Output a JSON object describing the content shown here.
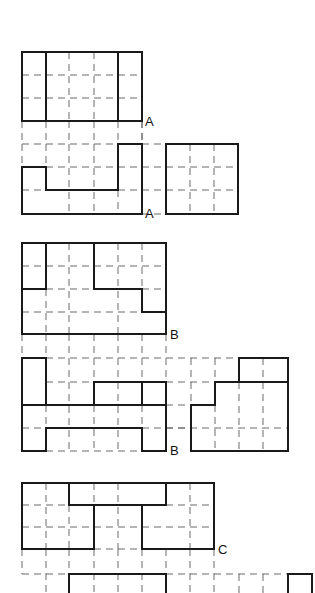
{
  "diagram": {
    "title": "",
    "colors": {
      "solid": "#1a1a1a",
      "dashed": "#6a6a6a",
      "background": "#ffffff"
    },
    "figures": [
      {
        "id": "A-top",
        "label": "A",
        "label_pos": [
          145,
          126
        ],
        "dashed": [
          [
            22,
            75,
            142,
            75
          ],
          [
            22,
            98,
            142,
            98
          ],
          [
            69,
            52,
            69,
            121
          ],
          [
            94,
            52,
            94,
            121
          ],
          [
            22,
            121,
            22,
            144
          ],
          [
            46,
            121,
            46,
            144
          ],
          [
            69,
            121,
            69,
            144
          ],
          [
            94,
            121,
            94,
            144
          ],
          [
            118,
            121,
            118,
            144
          ],
          [
            142,
            121,
            142,
            144
          ]
        ],
        "solid": [
          [
            22,
            52,
            142,
            52
          ],
          [
            22,
            121,
            142,
            121
          ],
          [
            22,
            52,
            22,
            121
          ],
          [
            142,
            52,
            142,
            121
          ],
          [
            46,
            52,
            46,
            121
          ],
          [
            118,
            52,
            118,
            121
          ]
        ]
      },
      {
        "id": "A-bottom",
        "label": "A",
        "label_pos": [
          145,
          218
        ],
        "dashed": [
          [
            22,
            144,
            166,
            144
          ],
          [
            22,
            167,
            166,
            167
          ],
          [
            22,
            190,
            166,
            190
          ],
          [
            46,
            144,
            46,
            167
          ],
          [
            69,
            144,
            69,
            214
          ],
          [
            94,
            144,
            94,
            214
          ],
          [
            118,
            167,
            118,
            190
          ],
          [
            118,
            190,
            118,
            214
          ],
          [
            22,
            144,
            22,
            167
          ],
          [
            142,
            121,
            142,
            144
          ],
          [
            142,
            214,
            166,
            214
          ],
          [
            166,
            167,
            238,
            167
          ],
          [
            166,
            190,
            238,
            190
          ],
          [
            190,
            144,
            190,
            214
          ],
          [
            214,
            144,
            214,
            214
          ]
        ],
        "solid": [
          [
            22,
            167,
            46,
            167
          ],
          [
            46,
            167,
            46,
            190
          ],
          [
            46,
            190,
            118,
            190
          ],
          [
            118,
            144,
            118,
            190
          ],
          [
            118,
            144,
            142,
            144
          ],
          [
            142,
            144,
            142,
            214
          ],
          [
            22,
            167,
            22,
            214
          ],
          [
            22,
            214,
            142,
            214
          ],
          [
            166,
            144,
            238,
            144
          ],
          [
            166,
            144,
            166,
            214
          ],
          [
            238,
            144,
            238,
            214
          ],
          [
            166,
            214,
            238,
            214
          ]
        ]
      },
      {
        "id": "B-top",
        "label": "B",
        "label_pos": [
          170,
          339
        ],
        "dashed": [
          [
            22,
            266,
            166,
            266
          ],
          [
            46,
            289,
            166,
            289
          ],
          [
            22,
            312,
            142,
            312
          ],
          [
            46,
            289,
            46,
            334
          ],
          [
            69,
            243,
            69,
            334
          ],
          [
            118,
            243,
            118,
            334
          ],
          [
            142,
            243,
            142,
            289
          ],
          [
            22,
            334,
            22,
            358
          ],
          [
            46,
            334,
            46,
            358
          ],
          [
            69,
            334,
            69,
            358
          ],
          [
            94,
            334,
            94,
            358
          ],
          [
            118,
            334,
            118,
            358
          ],
          [
            142,
            334,
            142,
            358
          ],
          [
            166,
            334,
            166,
            358
          ]
        ],
        "solid": [
          [
            22,
            243,
            166,
            243
          ],
          [
            22,
            243,
            22,
            334
          ],
          [
            166,
            243,
            166,
            334
          ],
          [
            22,
            334,
            166,
            334
          ],
          [
            46,
            243,
            46,
            289
          ],
          [
            22,
            289,
            46,
            289
          ],
          [
            94,
            243,
            94,
            289
          ],
          [
            94,
            289,
            142,
            289
          ],
          [
            142,
            289,
            142,
            312
          ],
          [
            142,
            312,
            166,
            312
          ]
        ]
      },
      {
        "id": "B-bottom",
        "label": "B",
        "label_pos": [
          170,
          455
        ],
        "dashed": [
          [
            46,
            358,
            239,
            358
          ],
          [
            46,
            382,
            94,
            382
          ],
          [
            166,
            382,
            215,
            382
          ],
          [
            22,
            428,
            46,
            428
          ],
          [
            142,
            428,
            288,
            428
          ],
          [
            166,
            405,
            191,
            405
          ],
          [
            69,
            358,
            69,
            451
          ],
          [
            94,
            358,
            94,
            382
          ],
          [
            94,
            405,
            94,
            451
          ],
          [
            118,
            358,
            118,
            451
          ],
          [
            142,
            358,
            142,
            382
          ],
          [
            142,
            405,
            142,
            428
          ],
          [
            166,
            358,
            166,
            382
          ],
          [
            191,
            358,
            191,
            405
          ],
          [
            215,
            358,
            215,
            382
          ],
          [
            215,
            405,
            215,
            451
          ],
          [
            239,
            382,
            239,
            451
          ],
          [
            263,
            358,
            263,
            451
          ],
          [
            46,
            405,
            46,
            428
          ],
          [
            46,
            451,
            142,
            451
          ],
          [
            166,
            428,
            191,
            428
          ]
        ],
        "solid": [
          [
            22,
            358,
            46,
            358
          ],
          [
            22,
            358,
            22,
            451
          ],
          [
            46,
            358,
            46,
            405
          ],
          [
            22,
            405,
            166,
            405
          ],
          [
            94,
            382,
            166,
            382
          ],
          [
            94,
            382,
            94,
            405
          ],
          [
            142,
            382,
            142,
            405
          ],
          [
            166,
            382,
            166,
            451
          ],
          [
            46,
            428,
            142,
            428
          ],
          [
            46,
            428,
            46,
            451
          ],
          [
            22,
            451,
            46,
            451
          ],
          [
            142,
            428,
            142,
            451
          ],
          [
            142,
            451,
            166,
            451
          ],
          [
            239,
            358,
            288,
            358
          ],
          [
            239,
            358,
            239,
            382
          ],
          [
            288,
            358,
            288,
            451
          ],
          [
            215,
            382,
            288,
            382
          ],
          [
            215,
            382,
            215,
            405
          ],
          [
            191,
            405,
            215,
            405
          ],
          [
            191,
            405,
            191,
            451
          ],
          [
            191,
            451,
            288,
            451
          ]
        ]
      },
      {
        "id": "C-top",
        "label": "C",
        "label_pos": [
          218,
          554
        ],
        "dashed": [
          [
            22,
            505,
            69,
            505
          ],
          [
            166,
            505,
            214,
            505
          ],
          [
            22,
            527,
            214,
            527
          ],
          [
            46,
            483,
            46,
            549
          ],
          [
            69,
            505,
            69,
            549
          ],
          [
            118,
            483,
            118,
            549
          ],
          [
            94,
            483,
            94,
            505
          ],
          [
            190,
            483,
            190,
            549
          ],
          [
            94,
            549,
            142,
            549
          ],
          [
            22,
            549,
            22,
            574
          ],
          [
            46,
            549,
            46,
            593
          ],
          [
            69,
            549,
            69,
            574
          ],
          [
            94,
            549,
            94,
            593
          ],
          [
            118,
            549,
            118,
            593
          ],
          [
            142,
            549,
            142,
            593
          ],
          [
            166,
            549,
            166,
            574
          ],
          [
            190,
            549,
            190,
            593
          ],
          [
            214,
            549,
            214,
            593
          ]
        ],
        "solid": [
          [
            22,
            483,
            214,
            483
          ],
          [
            22,
            483,
            22,
            549
          ],
          [
            214,
            483,
            214,
            549
          ],
          [
            69,
            483,
            69,
            505
          ],
          [
            69,
            505,
            166,
            505
          ],
          [
            166,
            483,
            166,
            505
          ],
          [
            94,
            505,
            94,
            549
          ],
          [
            22,
            549,
            94,
            549
          ],
          [
            142,
            505,
            142,
            549
          ],
          [
            142,
            549,
            214,
            549
          ]
        ]
      },
      {
        "id": "C-bottom",
        "label": "",
        "label_pos": [
          0,
          0
        ],
        "dashed": [
          [
            22,
            574,
            69,
            574
          ],
          [
            166,
            574,
            288,
            574
          ],
          [
            239,
            574,
            239,
            593
          ],
          [
            263,
            574,
            263,
            593
          ]
        ],
        "solid": [
          [
            69,
            574,
            166,
            574
          ],
          [
            69,
            574,
            69,
            593
          ],
          [
            166,
            574,
            166,
            593
          ],
          [
            288,
            574,
            312,
            574
          ],
          [
            288,
            574,
            288,
            593
          ],
          [
            312,
            574,
            312,
            593
          ]
        ]
      }
    ],
    "labels": {
      "A": "A",
      "B": "B",
      "C": "C"
    }
  }
}
